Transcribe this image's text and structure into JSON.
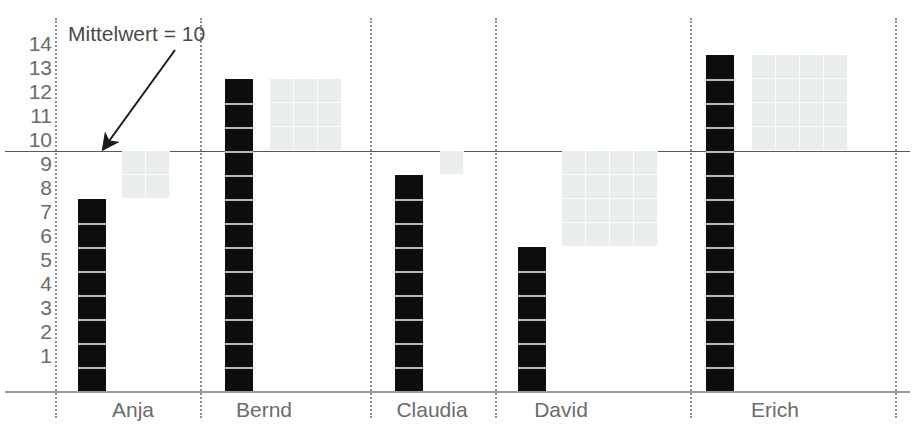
{
  "chart_data": {
    "type": "bar",
    "title": "",
    "annotation": "Mittelwert = 10",
    "xlabel": "",
    "ylabel": "",
    "ylim": [
      0,
      14.6
    ],
    "grid": false,
    "legend": "none",
    "mean": 10,
    "categories": [
      "Anja",
      "Bernd",
      "Claudia",
      "David",
      "Erich"
    ],
    "values": [
      8,
      13,
      9,
      6,
      14
    ],
    "yticks": [
      14,
      13,
      12,
      11,
      10,
      9,
      8,
      7,
      6,
      5,
      4,
      3,
      2,
      1
    ],
    "deviation_squares": [
      {
        "category": "Anja",
        "side": 2,
        "from": 8,
        "to": 10
      },
      {
        "category": "Bernd",
        "side": 3,
        "from": 10,
        "to": 13
      },
      {
        "category": "Claudia",
        "side": 1,
        "from": 9,
        "to": 10
      },
      {
        "category": "David",
        "side": 4,
        "from": 6,
        "to": 10
      },
      {
        "category": "Erich",
        "side": 4,
        "from": 10,
        "to": 14
      }
    ],
    "colors": {
      "bar": "#0d0d0d",
      "deviation_box": "#e9edee",
      "mean_line": "#5a5a5a",
      "separator": "#8e8e8e",
      "text": "#6b6b6b",
      "background": "#ffffff"
    }
  }
}
